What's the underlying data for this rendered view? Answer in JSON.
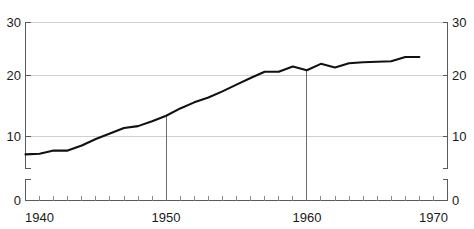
{
  "chart_data": {
    "type": "line",
    "title": "",
    "subtitle": "",
    "xlabel": "",
    "ylabel": "",
    "xlim": [
      1940,
      1970
    ],
    "ylim": [
      0,
      30
    ],
    "y_axis_break": true,
    "y_break_range": [
      0.2,
      4.6
    ],
    "grid": true,
    "gridlines_y": [
      10,
      20,
      30
    ],
    "legend": "none",
    "x_tick_labels": [
      "1940",
      "1950",
      "1970"
    ],
    "x_minor_tick_interval": 1,
    "y_tick_labels_left": [
      "0",
      "10",
      "20",
      "30"
    ],
    "y_tick_labels_right": [
      "0",
      "10",
      "20",
      "30"
    ],
    "y_tick_values": [
      0,
      10,
      20,
      30
    ],
    "annotations": [
      {
        "label": "1950",
        "x": 1950,
        "type": "vertical-drop-line",
        "y_top": 13.4,
        "y_bottom": 0
      },
      {
        "label": "1960",
        "x": 1960,
        "type": "vertical-drop-line",
        "y_top": 21.0,
        "y_bottom": 0
      }
    ],
    "series": [
      {
        "name": "series-1",
        "color": "#111111",
        "x": [
          1940,
          1941,
          1942,
          1943,
          1944,
          1945,
          1946,
          1947,
          1948,
          1949,
          1950,
          1951,
          1952,
          1953,
          1954,
          1955,
          1956,
          1957,
          1958,
          1959,
          1960,
          1961,
          1962,
          1963,
          1964,
          1965,
          1966,
          1967,
          1968
        ],
        "values": [
          7.2,
          7.3,
          7.8,
          7.8,
          8.6,
          9.6,
          10.5,
          11.4,
          11.7,
          12.5,
          13.4,
          14.6,
          15.6,
          16.4,
          17.4,
          18.5,
          19.6,
          20.7,
          20.7,
          21.7,
          21.0,
          22.2,
          21.5,
          22.3,
          22.5,
          22.6,
          22.7,
          23.5,
          23.5
        ]
      }
    ]
  },
  "axes": {
    "left": {
      "name": "left-value-axis",
      "labels": [
        "30",
        "20",
        "10",
        "0"
      ]
    },
    "right": {
      "name": "right-value-axis",
      "labels": [
        "30",
        "20",
        "10",
        "0"
      ]
    },
    "bottom": {
      "name": "bottom-year-axis",
      "labels": [
        "1940",
        "1950",
        "1970"
      ]
    }
  }
}
